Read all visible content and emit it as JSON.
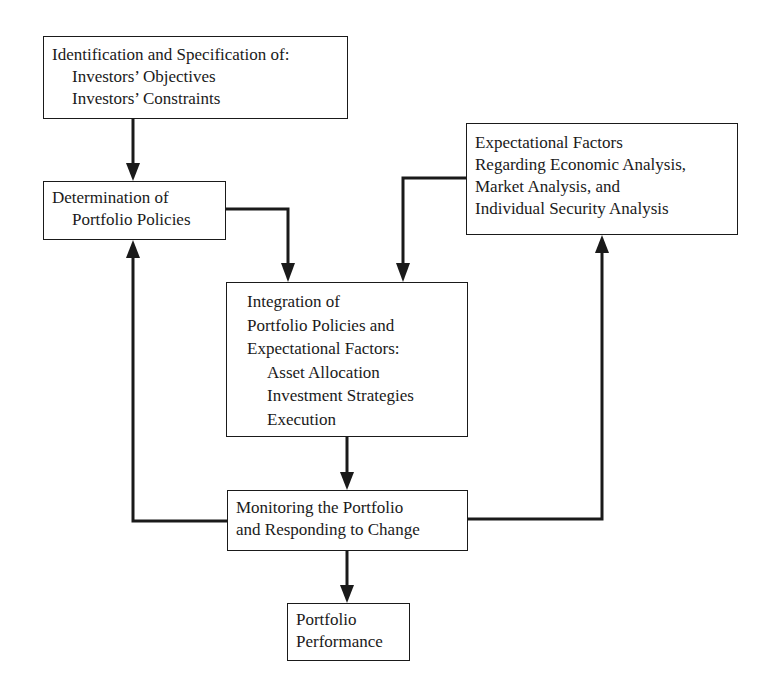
{
  "nodes": {
    "identification": {
      "title": "Identification and Specification of:",
      "items": [
        "Investors’ Objectives",
        "Investors’ Constraints"
      ]
    },
    "determination": {
      "lines": [
        "Determination of",
        "Portfolio Policies"
      ]
    },
    "expectational": {
      "lines": [
        "Expectational Factors",
        "Regarding Economic Analysis,",
        "Market Analysis, and",
        "Individual Security Analysis"
      ]
    },
    "integration": {
      "lines": [
        "Integration of",
        "Portfolio Policies and",
        "Expectational Factors:"
      ],
      "items": [
        "Asset Allocation",
        "Investment Strategies",
        "Execution"
      ]
    },
    "monitoring": {
      "lines": [
        "Monitoring the Portfolio",
        "and Responding to Change"
      ]
    },
    "performance": {
      "lines": [
        "Portfolio",
        "Performance"
      ]
    }
  },
  "edges": [
    {
      "from": "identification",
      "to": "determination"
    },
    {
      "from": "determination",
      "to": "integration"
    },
    {
      "from": "expectational",
      "to": "integration"
    },
    {
      "from": "integration",
      "to": "monitoring"
    },
    {
      "from": "monitoring",
      "to": "performance"
    },
    {
      "from": "monitoring",
      "to": "determination"
    },
    {
      "from": "monitoring",
      "to": "expectational"
    }
  ],
  "colors": {
    "stroke": "#1a1a1a",
    "background": "#ffffff"
  }
}
